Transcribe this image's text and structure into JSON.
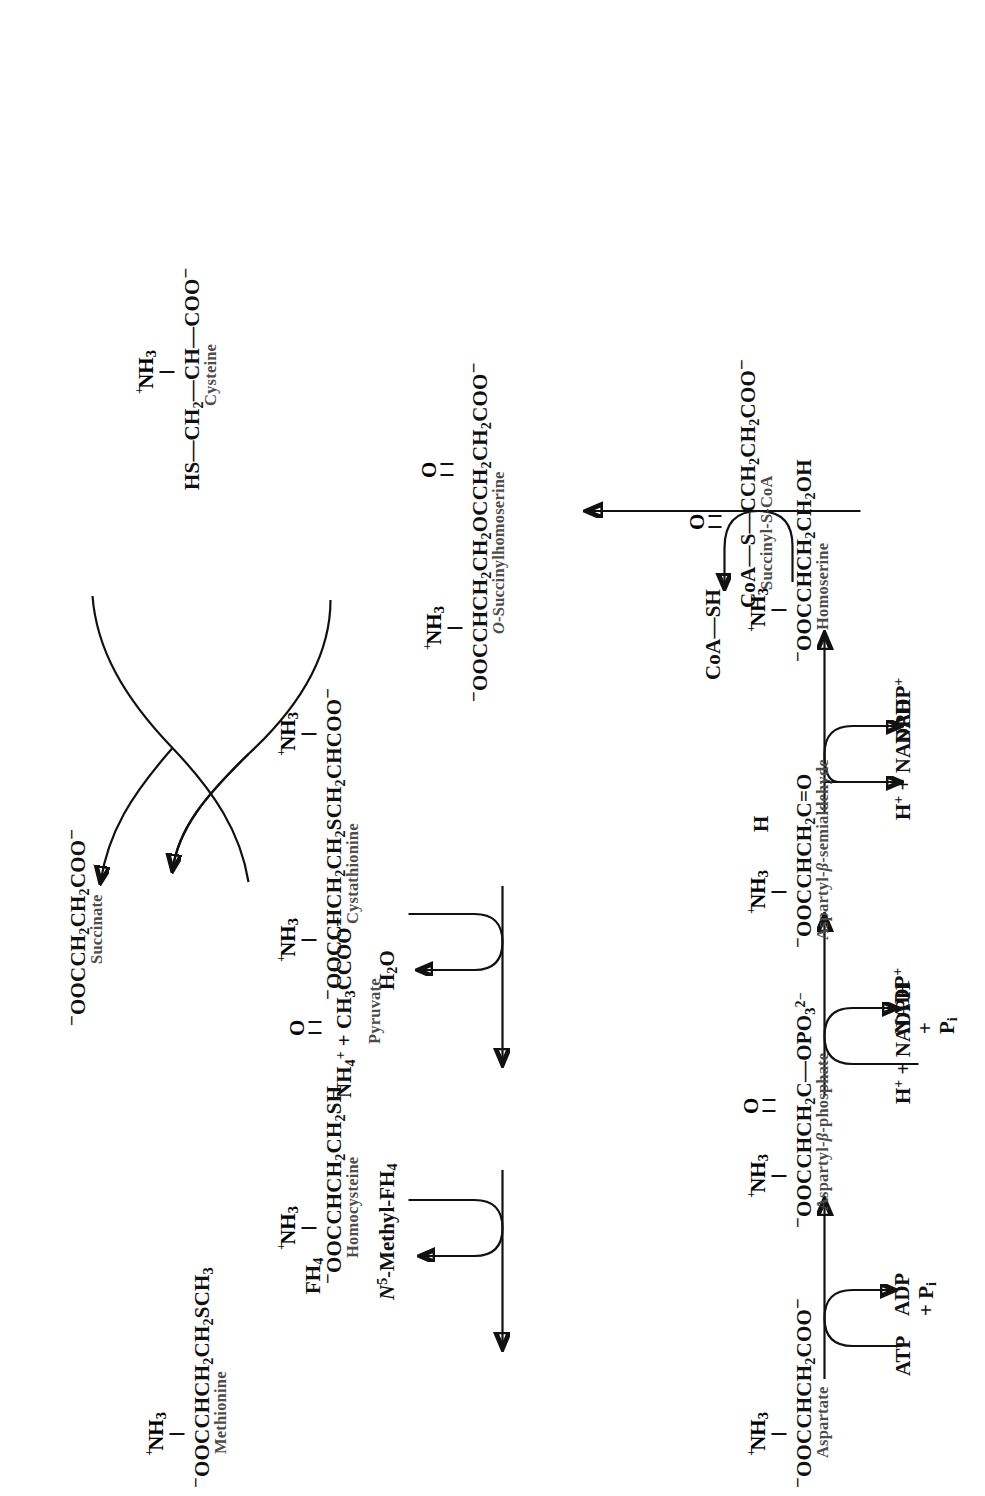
{
  "diagram": {
    "ink_color": "#111111",
    "name_color": "#4c4c4c",
    "background": "#ffffff"
  },
  "metabolites": [
    {
      "id": "aspartate",
      "formula_html": "<span class='minus'>−</span>OOCCHCH<sub>2</sub>COO<span class='minus'>−</span>",
      "name_html": "Aspartate",
      "amine": true,
      "carbonyl": false
    },
    {
      "id": "aspartyl-p",
      "formula_html": "<span class='minus'>−</span>OOCCHCH<sub>2</sub>C—OPO<sub>3</sub><sup>2−</sup>",
      "name_html": "Aspartyl-<span class='it'>β</span>-phosphate",
      "amine": true,
      "carbonyl": true
    },
    {
      "id": "aspartyl-sa",
      "formula_html": "<span class='minus'>−</span>OOCCHCH<sub>2</sub>C&#61;O",
      "name_html": "Aspartyl-<span class='it'>β</span>-semialdehyde",
      "amine": true,
      "carbonyl": false,
      "hydrogen": true
    },
    {
      "id": "homoserine",
      "formula_html": "<span class='minus'>−</span>OOCCHCH<sub>2</sub>CH<sub>2</sub>OH",
      "name_html": "Homoserine",
      "amine": true,
      "carbonyl": false
    },
    {
      "id": "o-succinylhomoserine",
      "formula_html": "<span class='minus'>−</span>OOCCHCH<sub>2</sub>CH<sub>2</sub>OCCH<sub>2</sub>CH<sub>2</sub>COO<span class='minus'>−</span>",
      "name_html": "<span class='it'>O</span>-Succinylhomoserine",
      "amine": true,
      "carbonyl": true
    },
    {
      "id": "cystathionine",
      "formula_html": "<span class='minus'>−</span>OOCCHCH<sub>2</sub>CH<sub>2</sub>SCH<sub>2</sub>CHCOO<span class='minus'>−</span>",
      "name_html": "Cystathionine",
      "amine": true,
      "carbonyl": false
    },
    {
      "id": "homocysteine",
      "formula_html": "<span class='minus'>−</span>OOCCHCH<sub>2</sub>CH<sub>2</sub>SH",
      "name_html": "Homocysteine",
      "amine": true,
      "carbonyl": false
    },
    {
      "id": "methionine",
      "formula_html": "<span class='minus'>−</span>OOCCHCH<sub>2</sub>CH<sub>2</sub>SCH<sub>3</sub>",
      "name_html": "Methionine",
      "amine": true,
      "carbonyl": false
    }
  ],
  "side_metabolites": [
    {
      "id": "succinyl-coa",
      "formula_html": "CoA—S—CCH<sub>2</sub>CH<sub>2</sub>COO<span class='minus'>−</span>",
      "name_html": "Succinyl-S-CoA"
    },
    {
      "id": "coa-sh",
      "formula_html": "CoA—SH",
      "name_html": ""
    },
    {
      "id": "cysteine",
      "formula_html": "HS—CH<sub>2</sub>—CH—COO<span class='minus'>−</span>",
      "name_html": "Cysteine"
    },
    {
      "id": "succinate",
      "formula_html": "<span class='minus'>−</span>OOCCH<sub>2</sub>CH<sub>2</sub>COO<span class='minus'>−</span>",
      "name_html": "Succinate"
    },
    {
      "id": "pyruvate",
      "formula_html": "NH<sub>4</sub><sup>+</sup> + CH<sub>3</sub>CCOO<span class='minus'>−</span>",
      "name_html": "Pyruvate"
    }
  ],
  "cofactors": {
    "atp": "ATP",
    "adp_pi": "ADP<br>+ P<sub>i</sub>",
    "h_nadph_1": "H<sup>+</sup> + NADPH",
    "nadp_pi": "NADP<sup>+</sup><br>+<br>P<sub>i</sub>",
    "h_nadph_2": "H<sup>+</sup> + NADPH",
    "nadp_2": "NADP<sup>+</sup>",
    "water": "H<sub>2</sub>O",
    "n5_methyl_fh4": "<span class='it'>N</span><sup>5</sup>-Methyl-FH<sub>4</sub>",
    "fh4": "FH<sub>4</sub>",
    "amine_label": "<span class='plus'>+</span>NH<sub>3</sub>",
    "oxygen_label": "O",
    "hydrogen_label": "H"
  },
  "steps": [
    {
      "from": "aspartate",
      "to": "aspartyl-p",
      "consumes": "ATP",
      "produces": "ADP + Pi"
    },
    {
      "from": "aspartyl-p",
      "to": "aspartyl-sa",
      "consumes": "H+ + NADPH",
      "produces": "NADP+ + Pi"
    },
    {
      "from": "aspartyl-sa",
      "to": "homoserine",
      "consumes": "H+ + NADPH",
      "produces": "NADP+"
    },
    {
      "from": "homoserine",
      "to": "o-succinylhomoserine",
      "consumes": "Succinyl-S-CoA",
      "produces": "CoA—SH"
    },
    {
      "from": "o-succinylhomoserine",
      "to": "cystathionine",
      "consumes": "Cysteine",
      "produces": "Succinate"
    },
    {
      "from": "cystathionine",
      "to": "homocysteine",
      "consumes": "H2O",
      "produces": "NH4+ + Pyruvate"
    },
    {
      "from": "homocysteine",
      "to": "methionine",
      "consumes": "N5-Methyl-FH4",
      "produces": "FH4"
    }
  ]
}
